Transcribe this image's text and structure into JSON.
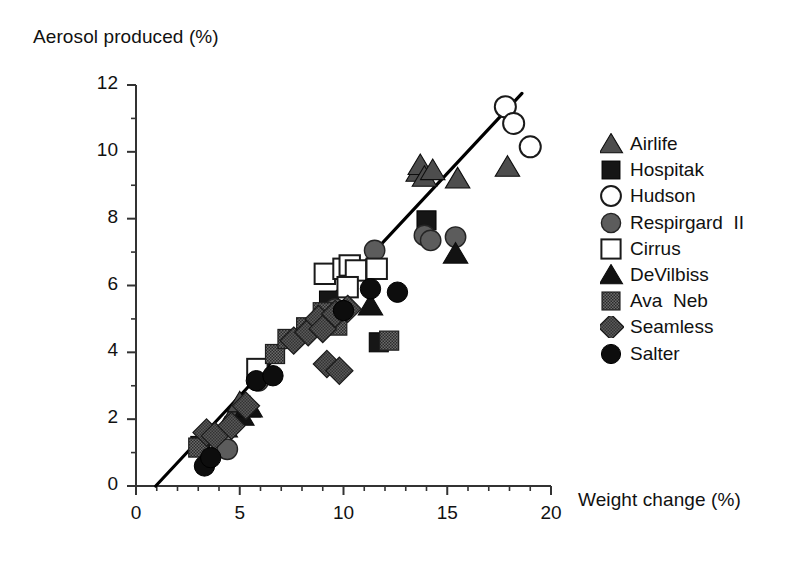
{
  "chart_data": {
    "type": "scatter",
    "title": "",
    "xlabel": "Weight change (%)",
    "ylabel": "Aerosol produced (%)",
    "xlim": [
      0,
      20
    ],
    "ylim": [
      0,
      12
    ],
    "xticks": [
      0,
      5,
      10,
      15,
      20
    ],
    "yticks": [
      0,
      2,
      4,
      6,
      8,
      10,
      12
    ],
    "xticklabels": [
      "0",
      "5",
      "10",
      "15",
      "20"
    ],
    "yticklabels": [
      "0",
      "2",
      "4",
      "6",
      "8",
      "10",
      "12"
    ],
    "x_minor_ticks": [
      1,
      2,
      3,
      4,
      6,
      7,
      8,
      9,
      11,
      12,
      13,
      14,
      16,
      17,
      18,
      19
    ],
    "y_minor_ticks": [
      1,
      3,
      5,
      7,
      9,
      11
    ],
    "grid": false,
    "legend_position": "right",
    "trendline": {
      "name": "regression-line",
      "x": [
        0.95,
        18.6
      ],
      "y": [
        0.0,
        11.75
      ],
      "color": "#000000"
    },
    "series": [
      {
        "name": "Airlife",
        "marker": "triangle-up",
        "fill": "#4d4d4d",
        "edge": "#1a1a1a",
        "points": [
          [
            4.3,
            1.75
          ],
          [
            4.8,
            2.25
          ],
          [
            5.0,
            2.5
          ],
          [
            5.4,
            2.35
          ],
          [
            13.6,
            9.4
          ],
          [
            13.7,
            9.6
          ],
          [
            13.9,
            9.25
          ],
          [
            14.3,
            9.45
          ],
          [
            15.5,
            9.2
          ],
          [
            17.9,
            9.55
          ]
        ]
      },
      {
        "name": "Hospitak",
        "marker": "square-filled",
        "fill": "#1a1a1a",
        "edge": "#000000",
        "points": [
          [
            3.1,
            1.2
          ],
          [
            9.3,
            5.55
          ],
          [
            11.7,
            4.3
          ],
          [
            14.0,
            7.95
          ]
        ]
      },
      {
        "name": "Hudson",
        "marker": "circle-open",
        "fill": "#ffffff",
        "edge": "#1a1a1a",
        "points": [
          [
            17.8,
            11.35
          ],
          [
            18.2,
            10.85
          ],
          [
            19.0,
            10.15
          ]
        ]
      },
      {
        "name": "Respirgard  II",
        "marker": "circle-filled-gray",
        "fill": "#595959",
        "edge": "#262626",
        "points": [
          [
            4.4,
            1.1
          ],
          [
            5.9,
            3.15
          ],
          [
            9.6,
            5.3
          ],
          [
            11.5,
            7.05
          ],
          [
            13.9,
            7.5
          ],
          [
            14.2,
            7.35
          ],
          [
            15.4,
            7.45
          ]
        ]
      },
      {
        "name": "Cirrus",
        "marker": "square-open",
        "fill": "#ffffff",
        "edge": "#1a1a1a",
        "points": [
          [
            5.85,
            3.5
          ],
          [
            9.1,
            6.35
          ],
          [
            10.0,
            6.5
          ],
          [
            10.3,
            6.6
          ],
          [
            10.6,
            6.45
          ],
          [
            10.2,
            5.95
          ],
          [
            11.6,
            6.5
          ]
        ]
      },
      {
        "name": "DeVilbiss",
        "marker": "triangle-up-dark",
        "fill": "#111111",
        "edge": "#000000",
        "points": [
          [
            5.1,
            2.1
          ],
          [
            5.5,
            2.35
          ],
          [
            11.3,
            5.4
          ],
          [
            15.4,
            6.95
          ]
        ]
      },
      {
        "name": "Ava  Neb",
        "marker": "square-hatch",
        "fill": "#555555",
        "edge": "#1a1a1a",
        "points": [
          [
            3.0,
            1.15
          ],
          [
            6.7,
            3.95
          ],
          [
            7.3,
            4.4
          ],
          [
            8.2,
            4.75
          ],
          [
            9.0,
            5.2
          ],
          [
            9.4,
            4.95
          ],
          [
            9.7,
            4.8
          ],
          [
            12.2,
            4.35
          ]
        ]
      },
      {
        "name": "Seamless",
        "marker": "diamond",
        "fill": "#4a4a4a",
        "edge": "#1a1a1a",
        "points": [
          [
            3.4,
            1.6
          ],
          [
            3.8,
            1.5
          ],
          [
            4.6,
            1.8
          ],
          [
            5.3,
            2.4
          ],
          [
            7.6,
            4.35
          ],
          [
            8.3,
            4.6
          ],
          [
            8.8,
            5.0
          ],
          [
            9.0,
            4.7
          ],
          [
            9.6,
            5.15
          ],
          [
            10.2,
            5.3
          ],
          [
            9.2,
            3.65
          ],
          [
            9.8,
            3.45
          ]
        ]
      },
      {
        "name": "Salter",
        "marker": "circle-filled-black",
        "fill": "#0d0d0d",
        "edge": "#000000",
        "points": [
          [
            3.3,
            0.6
          ],
          [
            3.6,
            0.85
          ],
          [
            5.8,
            3.15
          ],
          [
            6.6,
            3.3
          ],
          [
            10.0,
            5.25
          ],
          [
            11.3,
            5.9
          ],
          [
            12.6,
            5.8
          ]
        ]
      }
    ]
  },
  "axis": {
    "ylabel_text": "Aerosol produced (%)",
    "xlabel_text": "Weight change (%)"
  },
  "legend": {
    "items": [
      {
        "label": "Airlife",
        "marker": "triangle-up"
      },
      {
        "label": "Hospitak",
        "marker": "square-filled"
      },
      {
        "label": "Hudson",
        "marker": "circle-open"
      },
      {
        "label": "Respirgard  II",
        "marker": "circle-filled-gray"
      },
      {
        "label": "Cirrus",
        "marker": "square-open"
      },
      {
        "label": "DeVilbiss",
        "marker": "triangle-up-dark"
      },
      {
        "label": "Ava  Neb",
        "marker": "square-hatch"
      },
      {
        "label": "Seamless",
        "marker": "diamond"
      },
      {
        "label": "Salter",
        "marker": "circle-filled-black"
      }
    ]
  },
  "colors": {
    "axis": "#333333",
    "text": "#111111",
    "line": "#000000",
    "background": "#ffffff"
  }
}
